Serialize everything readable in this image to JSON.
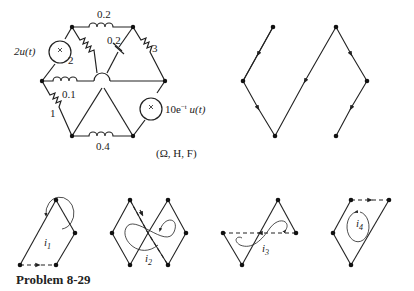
{
  "caption": "Problem 8-29",
  "units_label": "(Ω, H, F)",
  "circuit": {
    "elements": [
      {
        "type": "inductor",
        "value": "0.2",
        "between": "top-left to top-right"
      },
      {
        "type": "resistor",
        "value": "2",
        "between": "top-left to center"
      },
      {
        "type": "capacitor",
        "value": "0.2",
        "between": "top-right to center"
      },
      {
        "type": "resistor",
        "value": "3",
        "between": "top-right to right"
      },
      {
        "type": "current-source",
        "value": "2u(t)",
        "between": "top-left to left"
      },
      {
        "type": "inductor",
        "value": "0.1",
        "between": "left to center"
      },
      {
        "type": "resistor",
        "value": "1",
        "between": "left to bottom-left"
      },
      {
        "type": "inductor",
        "value": "0.4",
        "between": "bottom-left to bottom-right"
      },
      {
        "type": "current-source",
        "value": "10e^{-t} u(t)",
        "between": "right to bottom-right"
      }
    ],
    "labels": {
      "l_top": "0.2",
      "r2": "2",
      "c_top": "0.2",
      "r3": "3",
      "src1": "2u(t)",
      "l_mid": "0.1",
      "r1": "1",
      "l_bot": "0.4",
      "src2": "10e",
      "src2_exp": "−t",
      "src2_tail": " u(t)"
    }
  },
  "tree_graph": {
    "description": "oriented tree with arrows"
  },
  "loops": [
    {
      "name": "i1",
      "label": "i",
      "sub": "1"
    },
    {
      "name": "i2",
      "label": "i",
      "sub": "2"
    },
    {
      "name": "i3",
      "label": "i",
      "sub": "3"
    },
    {
      "name": "i4",
      "label": "i",
      "sub": "4"
    }
  ]
}
